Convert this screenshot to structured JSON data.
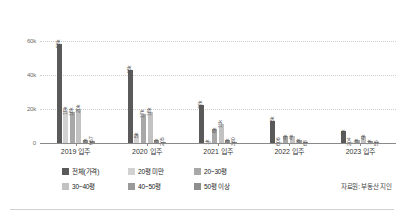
{
  "chart_data": {
    "type": "bar",
    "title": "",
    "xlabel": "",
    "ylabel": "",
    "ylim": [
      0,
      68000
    ],
    "grid": true,
    "legend_position": "bottom",
    "categories": [
      "2019 입주",
      "2020 입주",
      "2021 입주",
      "2022 입주",
      "2023 입주"
    ],
    "ytick_labels": [
      "0",
      "20k",
      "40k",
      "60k"
    ],
    "ytick_values": [
      0,
      20000,
      40000,
      60000
    ],
    "series": [
      {
        "name": "전체(가격)",
        "color": "#5a5a5a",
        "values": [
          58000,
          43000,
          22000,
          13000,
          7000
        ],
        "labels": [
          "58k",
          "43k",
          "22k",
          "13k",
          "7k"
        ]
      },
      {
        "name": "20평 미만",
        "color": "#d2d2d2",
        "values": [
          19000,
          5000,
          1000,
          606,
          204
        ],
        "labels": [
          "19k",
          "5k",
          "1k",
          "606",
          "204"
        ]
      },
      {
        "name": "20~30평",
        "color": "#a8a8a8",
        "values": [
          18000,
          17000,
          8000,
          4000,
          2000
        ],
        "labels": [
          "18k",
          "17k",
          "8k",
          "4k",
          "2k"
        ]
      },
      {
        "name": "30~40평",
        "color": "#c2c2c2",
        "values": [
          20000,
          18000,
          11000,
          4000,
          4000
        ],
        "labels": [
          "20k",
          "18k",
          "11k",
          "4k",
          "4k"
        ]
      },
      {
        "name": "40~50평",
        "color": "#9a9a9a",
        "values": [
          2000,
          2000,
          2000,
          2000,
          1000
        ],
        "labels": [
          "2k",
          "2k",
          "2k",
          "2k",
          "1k"
        ]
      },
      {
        "name": "50평 이상",
        "color": "#8e8e8e",
        "values": [
          957,
          205,
          380,
          68,
          55
        ],
        "labels": [
          "957",
          "205",
          "380",
          "68",
          "55"
        ]
      }
    ]
  },
  "source_note": "자료원: 부동산 지인"
}
